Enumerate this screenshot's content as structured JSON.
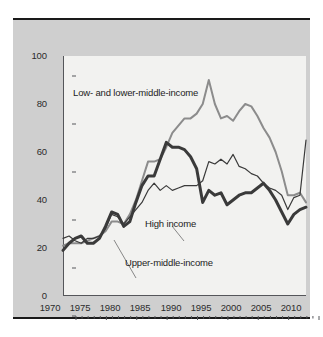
{
  "chart_data": {
    "type": "line",
    "title": "",
    "subtitle": "",
    "xlabel": "",
    "ylabel": "",
    "xlim": [
      1970,
      2010
    ],
    "ylim": [
      0,
      100
    ],
    "grid": false,
    "legend_position": "inline-annotations",
    "x_ticks": [
      1970,
      1975,
      1980,
      1985,
      1990,
      1995,
      2000,
      2005,
      2010
    ],
    "x_minor_tick_interval": 1,
    "y_ticks": [
      0,
      20,
      40,
      60,
      80,
      100
    ],
    "x": [
      1970,
      1971,
      1972,
      1973,
      1974,
      1975,
      1976,
      1977,
      1978,
      1979,
      1980,
      1981,
      1982,
      1983,
      1984,
      1985,
      1986,
      1987,
      1988,
      1989,
      1990,
      1991,
      1992,
      1993,
      1994,
      1995,
      1996,
      1997,
      1998,
      1999,
      2000,
      2001,
      2002,
      2003,
      2004,
      2005,
      2006,
      2007,
      2008,
      2009,
      2010
    ],
    "series": [
      {
        "name": "Low- and lower-middle-income",
        "color": "#8c8c8c",
        "width": 2.0,
        "values": [
          21,
          22,
          22,
          22,
          23,
          24,
          25,
          27,
          31,
          31,
          30,
          34,
          40,
          48,
          56,
          56,
          57,
          62,
          68,
          71,
          74,
          74,
          76,
          80,
          90,
          80,
          74,
          75,
          73,
          77,
          80,
          79,
          75,
          70,
          66,
          60,
          52,
          42,
          42,
          43,
          39
        ]
      },
      {
        "name": "Upper-middle-income",
        "color": "#3a3a3a",
        "width": 3.0,
        "values": [
          19,
          22,
          24,
          25,
          22,
          22,
          24,
          29,
          35,
          34,
          29,
          31,
          39,
          46,
          50,
          50,
          57,
          64,
          62,
          62,
          61,
          58,
          53,
          39,
          44,
          42,
          43,
          38,
          40,
          42,
          43,
          43,
          45,
          47,
          44,
          40,
          35,
          30,
          34,
          36,
          37
        ]
      },
      {
        "name": "High income",
        "color": "#3a3a3a",
        "width": 1.2,
        "values": [
          24,
          25,
          23,
          22,
          24,
          24,
          25,
          28,
          34,
          33,
          30,
          33,
          36,
          39,
          44,
          47,
          44,
          46,
          44,
          45,
          46,
          46,
          46,
          48,
          56,
          55,
          57,
          55,
          59,
          54,
          53,
          51,
          50,
          47,
          45,
          44,
          42,
          36,
          41,
          42,
          65
        ]
      }
    ],
    "annotations": [
      {
        "name": "low-income-label",
        "text": "Low- and lower-middle-income",
        "x_px": 60,
        "y_px": 73
      },
      {
        "name": "high-income-label",
        "text": "High income",
        "x_px": 132,
        "y_px": 204
      },
      {
        "name": "upper-middle-income-label",
        "text": "Upper-middle-income",
        "x_px": 112,
        "y_px": 243
      }
    ]
  },
  "axis": {
    "y_labels": [
      "100",
      "80",
      "60",
      "40",
      "20",
      "0"
    ],
    "x_labels": [
      "1970",
      "1975",
      "1980",
      "1985",
      "1990",
      "1995",
      "2000",
      "2005",
      "2010"
    ]
  },
  "colors": {
    "panel_background": "#cfcfcf",
    "plot_background": "#f2f2f0",
    "axis": "#55565a",
    "rule": "#1a1a1a",
    "low_income_line": "#8c8c8c",
    "upper_middle_line": "#3a3a3a",
    "high_income_line": "#3a3a3a",
    "text": "#2b2b2b"
  }
}
